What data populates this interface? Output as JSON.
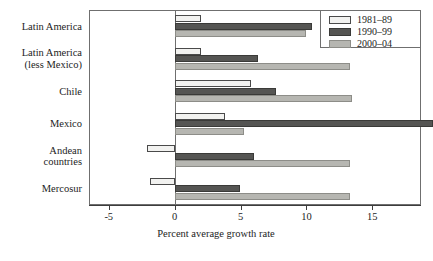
{
  "chart_data": {
    "type": "bar",
    "orientation": "horizontal",
    "title": "",
    "xlabel": "Percent average growth rate",
    "ylabel": "",
    "xlim": [
      -6.5,
      18.7
    ],
    "xticks": [
      -5,
      0,
      5,
      10,
      15
    ],
    "xticklabels": [
      "-5",
      "0",
      "5",
      "10",
      "15"
    ],
    "grid": false,
    "legend_position": "top-right",
    "categories": [
      "Latin America",
      "Latin America\n(less Mexico)",
      "Chile",
      "Mexico",
      "Andean\ncountries",
      "Mercosur"
    ],
    "series": [
      {
        "name": "1981–89",
        "color": "#f2f2f0",
        "values": [
          2.0,
          2.0,
          5.8,
          3.8,
          -2.1,
          -1.9
        ]
      },
      {
        "name": "1990–99",
        "color": "#555553",
        "values": [
          10.4,
          6.3,
          7.7,
          19.6,
          6.0,
          5.0
        ]
      },
      {
        "name": "2000–04",
        "color": "#b6b6b1",
        "values": [
          10.0,
          13.3,
          13.5,
          5.3,
          13.3,
          13.3
        ]
      }
    ]
  },
  "legend": {
    "items": [
      {
        "label": "1981–89"
      },
      {
        "label": "1990–99"
      },
      {
        "label": "2000–04"
      }
    ]
  },
  "axis": {
    "x_title": "Percent average growth rate"
  }
}
